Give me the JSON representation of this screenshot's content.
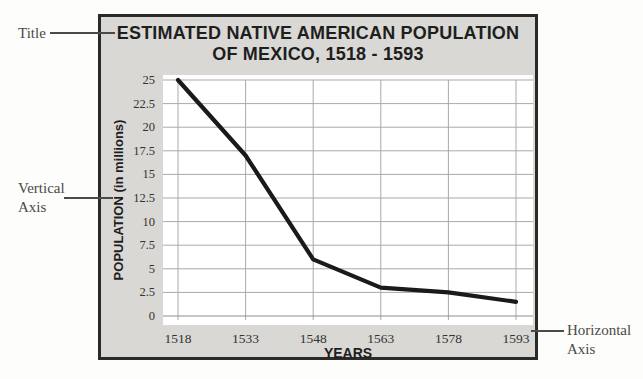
{
  "callouts": {
    "title_label": "Title",
    "vertical_axis_line1": "Vertical",
    "vertical_axis_line2": "Axis",
    "horizontal_axis_line1": "Horizontal",
    "horizontal_axis_line2": "Axis"
  },
  "chart": {
    "title_line1": "ESTIMATED NATIVE AMERICAN POPULATION",
    "title_line2": "OF MEXICO, 1518 - 1593",
    "colors": {
      "box_background": "#d9d8d4",
      "box_border": "#2a2a28",
      "plot_background": "#ffffff",
      "grid": "#a9a9a9",
      "line": "#1a1a1a",
      "callout_text": "#4a4a48"
    }
  },
  "chart_data": {
    "type": "line",
    "title": "ESTIMATED NATIVE AMERICAN POPULATION OF MEXICO, 1518 - 1593",
    "xlabel": "YEARS",
    "ylabel": "POPULATION (in millions)",
    "x": [
      1518,
      1533,
      1548,
      1563,
      1578,
      1593
    ],
    "y": [
      25,
      17,
      6,
      3,
      2.5,
      1.5
    ],
    "x_ticks": [
      "1518",
      "1533",
      "1548",
      "1563",
      "1578",
      "1593"
    ],
    "y_ticks": [
      "25",
      "22.5",
      "20",
      "17.5",
      "15",
      "12.5",
      "10",
      "7.5",
      "5",
      "2.5",
      "0"
    ],
    "ylim": [
      0,
      25
    ],
    "grid": true,
    "legend": false,
    "line_color": "#1a1a1a"
  }
}
